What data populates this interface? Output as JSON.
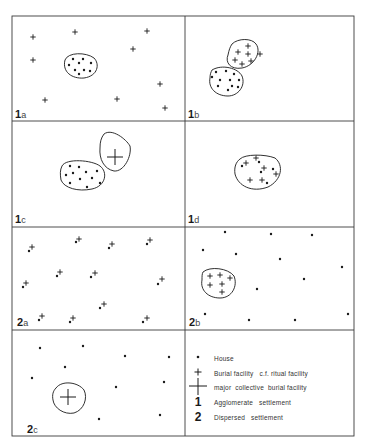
{
  "figure": {
    "grid": {
      "left": 12,
      "right": 354,
      "mid_x": 185,
      "rows_y": [
        16,
        121,
        227,
        330,
        436
      ]
    },
    "colors": {
      "line": "#3a3a3a",
      "ink": "#1a1a1a",
      "background": "#ffffff"
    },
    "panels": [
      {
        "id": "1a",
        "number": "1",
        "letter": "a",
        "description": "Houses clustered in agglomerate settlement, burial facilities dispersed"
      },
      {
        "id": "1b",
        "number": "1",
        "letter": "b",
        "description": "Houses clustered next to clustered burial facilities"
      },
      {
        "id": "1c",
        "number": "1",
        "letter": "c",
        "description": "Houses clustered next to a major collective burial facility"
      },
      {
        "id": "1d",
        "number": "1",
        "letter": "d",
        "description": "Houses and burial facilities mixed in one cluster"
      },
      {
        "id": "2a",
        "number": "2",
        "letter": "a",
        "description": "Dispersed houses each with an adjacent burial facility"
      },
      {
        "id": "2b",
        "number": "2",
        "letter": "b",
        "description": "Dispersed houses with a clustered burial facility area"
      },
      {
        "id": "2c",
        "number": "2",
        "letter": "c",
        "description": "Dispersed houses with a major collective burial facility"
      }
    ]
  },
  "legend": {
    "items": [
      {
        "symbol": "dot",
        "symbol_icon": "house-dot-icon",
        "text": "House"
      },
      {
        "symbol": "small-cross",
        "symbol_icon": "burial-cross-icon",
        "text": "Burial facility   c.f. ritual facility"
      },
      {
        "symbol": "large-cross",
        "symbol_icon": "collective-burial-cross-icon",
        "text": "major  collective  burial facility"
      },
      {
        "symbol": "1",
        "symbol_icon": "numeral-1",
        "text": "Agglomerate   settlement"
      },
      {
        "symbol": "2",
        "symbol_icon": "numeral-2",
        "text": "Dispersed   settlement"
      }
    ]
  }
}
